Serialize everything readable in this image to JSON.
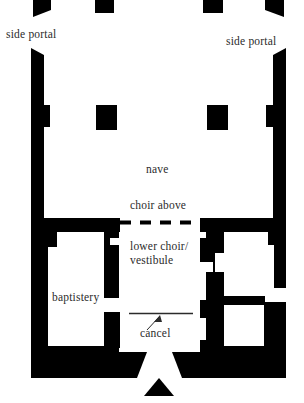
{
  "figure": {
    "kind": "architectural-floor-plan",
    "poche_color": "#000000",
    "background_color": "#ffffff",
    "text_color": "#2b2b2b"
  },
  "labels": {
    "side_portal_left": "side portal",
    "side_portal_right": "side portal",
    "nave": "nave",
    "choir_above": "choir above",
    "lower_choir_vestibule": "lower choir/\nvestibule",
    "baptistery": "baptistery",
    "cancel": "cancel"
  },
  "annotations": {
    "choir_above_divider": "dashed-line",
    "cancel_leader": "leader-line-with-arrowhead",
    "cancel_rail": "solid-line"
  },
  "elements": {
    "top_wall_stubs": [
      {
        "name": "top-wall-stub-outer-left",
        "splayed": true
      },
      {
        "name": "top-wall-stub-inner-left",
        "splayed": false
      },
      {
        "name": "top-wall-stub-inner-right",
        "splayed": false
      },
      {
        "name": "top-wall-stub-outer-right",
        "splayed": true
      }
    ],
    "nave_piers": [
      {
        "name": "nave-pier-left"
      },
      {
        "name": "nave-pier-right"
      }
    ],
    "side_walls": [
      {
        "name": "left-nave-wall",
        "has_inner_nub": true
      },
      {
        "name": "right-nave-wall",
        "has_inner_nub": true
      }
    ],
    "rooms": [
      {
        "name": "baptistery-room"
      },
      {
        "name": "right-stepped-room"
      }
    ],
    "entrance": {
      "name": "bottom-entrance-funnel",
      "marker": "triangle"
    }
  }
}
